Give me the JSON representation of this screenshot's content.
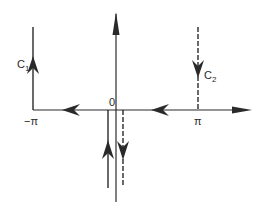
{
  "diagram": {
    "type": "contour-integration-diagram",
    "origin_label": "0",
    "left_tick_label": "−π",
    "right_tick_label": "π",
    "contours": [
      {
        "name": "C1",
        "label_main": "C",
        "label_sub": "1",
        "position": "x = −π",
        "direction": "up",
        "style": "solid"
      },
      {
        "name": "C2",
        "label_main": "C",
        "label_sub": "2",
        "position": "x = π",
        "direction": "down",
        "style": "dashed"
      }
    ],
    "bottom_paths": [
      {
        "side": "left of imaginary axis",
        "direction": "up",
        "style": "solid"
      },
      {
        "side": "right of imaginary axis",
        "direction": "down",
        "style": "dashed"
      }
    ],
    "real_axis_arrows": [
      "left (between −π and 0)",
      "left (between 0 and π)",
      "right (end of axis)"
    ],
    "imag_axis_arrow": "up",
    "colors": {
      "ink": "#2a2a2a",
      "background": "#ffffff"
    }
  }
}
